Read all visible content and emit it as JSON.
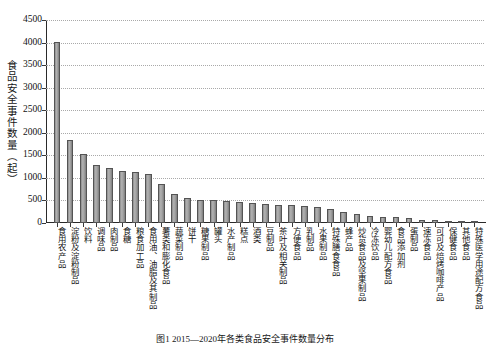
{
  "chart_data": {
    "type": "bar",
    "title": "",
    "xlabel": "",
    "ylabel": "食品安全事件数量（起）",
    "ylim": [
      0,
      4500
    ],
    "ytick_step": 500,
    "ytick_labels": [
      "4500",
      "4000",
      "3500",
      "3000",
      "2500",
      "2000",
      "1500",
      "1000",
      "500",
      "0"
    ],
    "grid": true,
    "legend": false,
    "bar_color": "#9a9a9a",
    "bar_edge_color": "#545454",
    "categories": [
      "食用农产品",
      "淀粉及淀粉制品",
      "饮料",
      "调味品",
      "肉制品",
      "食糖",
      "粮食加工品",
      "食用油、油脂及其制品",
      "薯类和膨化食品",
      "蔬菜制品",
      "饼干",
      "糖果制品",
      "罐头",
      "水产制品",
      "糕点",
      "酒类",
      "豆制品",
      "茶叶及相关制品",
      "方便食品",
      "乳制品",
      "水果制品",
      "特殊膳食食品",
      "蜂产品",
      "炒货食品及坚果制品",
      "冷冻饮品",
      "婴幼儿配方食品",
      "食品添加剂",
      "蛋制品",
      "速冻食品",
      "可可及焙烤咖啡产品",
      "保健食品",
      "其他食品",
      "特殊医学用途配方食品"
    ],
    "values": [
      4020,
      1830,
      1530,
      1280,
      1210,
      1150,
      1120,
      1080,
      860,
      650,
      560,
      520,
      520,
      480,
      455,
      440,
      420,
      400,
      390,
      370,
      350,
      320,
      250,
      200,
      150,
      140,
      130,
      110,
      75,
      60,
      45,
      30,
      15
    ]
  },
  "caption": {
    "text": "图1  2015—2020年各类食品安全事件数量分布"
  },
  "axis": {
    "y_title": "食品安全事件数量（起）"
  }
}
